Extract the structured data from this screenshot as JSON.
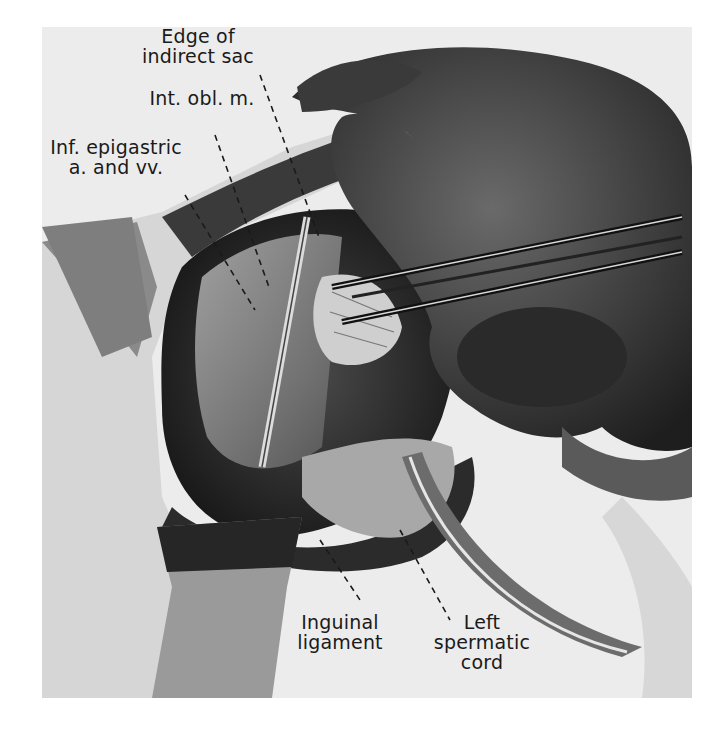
{
  "figure": {
    "labels": [
      {
        "id": "edge-of-indirect-sac",
        "text": "Edge of\nindirect sac"
      },
      {
        "id": "int-obl-m",
        "text": "Int. obl. m."
      },
      {
        "id": "inf-epigastric",
        "text": "Inf. epigastric\na. and vv."
      },
      {
        "id": "inguinal-ligament",
        "text": "Inguinal\nligament"
      },
      {
        "id": "left-spermatic-cord",
        "text": "Left\nspermatic\ncord"
      }
    ],
    "colors": {
      "background": "#ffffff",
      "plate": "#ececec",
      "ink": "#1a1a1a"
    }
  }
}
